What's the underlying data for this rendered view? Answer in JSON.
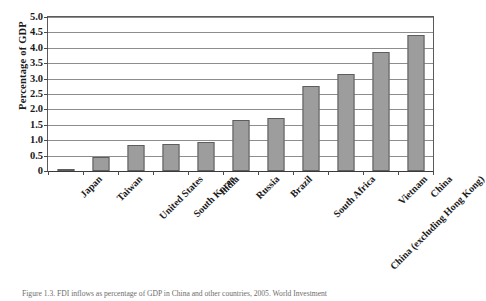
{
  "figure": {
    "caption": "Figure 1.3. FDI inflows as percentage of GDP in China and other countries, 2005. World Investment"
  },
  "chart_data": {
    "type": "bar",
    "title": "",
    "xlabel": "",
    "ylabel": "Percentage of GDP",
    "ylim": [
      0,
      5.0
    ],
    "yticks": [
      0,
      0.5,
      1.0,
      1.5,
      2.0,
      2.5,
      3.0,
      3.5,
      4.0,
      4.5,
      5.0
    ],
    "ytick_labels": [
      "0",
      "0.5",
      "1.0",
      "1.5",
      "2.0",
      "2.5",
      "3.0",
      "3.5",
      "4.0",
      "4.5",
      "5.0"
    ],
    "grid": true,
    "legend": null,
    "bar_color": "#9d9d9d",
    "bar_edge_color": "#5d5d5d",
    "categories": [
      "Japan",
      "Taiwan",
      "United States",
      "South Korea",
      "India",
      "Russia",
      "Brazil",
      "South Africa",
      "China (excluding Hong Kong)",
      "Vietnam",
      "China"
    ],
    "values": [
      0.07,
      0.46,
      0.84,
      0.88,
      0.94,
      1.67,
      1.71,
      2.77,
      3.16,
      3.85,
      4.42
    ]
  }
}
